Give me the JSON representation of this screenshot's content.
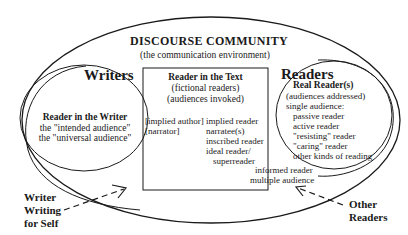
{
  "community": {
    "title": "DISCOURSE COMMUNITY",
    "subtitle": "(the communication environment)"
  },
  "writers": {
    "heading": "Writers",
    "inner_title": "Reader in the Writer",
    "lines": [
      "the \"intended audience\"",
      "the \"universal audience\""
    ]
  },
  "text_box": {
    "title": "Reader in the Text",
    "sub1": "(fictional readers)",
    "sub2": "(audiences invoked)",
    "left_items": [
      "[implied author]",
      "[narrator]"
    ],
    "right_items": [
      "implied reader",
      "narratee(s)",
      "inscribed reader",
      "ideal reader/",
      "superreader"
    ],
    "bottom_items": [
      "informed reader",
      "multiple audience"
    ]
  },
  "readers": {
    "heading": "Readers",
    "inner_title": "Real Reader(s)",
    "sub": "(audiences addressed)",
    "single_label": "single audience:",
    "items": [
      "passive reader",
      "active reader",
      "\"resisting\" reader",
      "\"caring\" reader",
      "other kinds of reading"
    ]
  },
  "annotations": {
    "writer_self": [
      "Writer",
      "Writing",
      "for Self"
    ],
    "other_readers": [
      "Other",
      "Readers"
    ]
  }
}
